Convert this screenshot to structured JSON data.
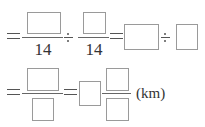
{
  "row1": {
    "equals": "=",
    "fraction1": {
      "numerator": "",
      "denominator": "14"
    },
    "operator1": "÷",
    "fraction2": {
      "numerator": "",
      "denominator": "14"
    },
    "equals2": "=",
    "box1": "",
    "operator2": "÷",
    "box2": ""
  },
  "row2": {
    "equals": "=",
    "fraction1": {
      "numerator": "",
      "denominator": ""
    },
    "equals2": "=",
    "mixed_number": {
      "whole": "",
      "numerator": "",
      "denominator": ""
    },
    "unit": "(km)"
  }
}
